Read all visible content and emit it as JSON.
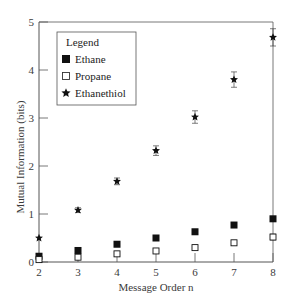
{
  "chart_data": {
    "type": "scatter",
    "title": "",
    "xlabel": "Message Order n",
    "ylabel": "Mutual Information (bits)",
    "x": [
      2,
      3,
      4,
      5,
      6,
      7,
      8
    ],
    "xlim": [
      2,
      8
    ],
    "ylim": [
      0,
      5
    ],
    "xticks": [
      "2",
      "3",
      "4",
      "5",
      "6",
      "7",
      "8"
    ],
    "yticks": [
      "0",
      "1",
      "2",
      "3",
      "4",
      "5"
    ],
    "grid": false,
    "legend_title": "Legend",
    "legend_position": "upper-left",
    "series": [
      {
        "name": "Ethane",
        "marker": "filled-square",
        "color": "#111111",
        "values": [
          0.12,
          0.24,
          0.37,
          0.5,
          0.63,
          0.77,
          0.9
        ],
        "error": [
          0,
          0,
          0,
          0,
          0,
          0,
          0
        ]
      },
      {
        "name": "Propane",
        "marker": "open-square",
        "color": "#111111",
        "values": [
          0.05,
          0.1,
          0.17,
          0.23,
          0.3,
          0.4,
          0.52
        ],
        "error": [
          0,
          0.03,
          0.03,
          0.03,
          0.04,
          0.05,
          0.06
        ]
      },
      {
        "name": "Ethanethiol",
        "marker": "star",
        "color": "#111111",
        "values": [
          0.5,
          1.08,
          1.68,
          2.32,
          3.02,
          3.8,
          4.68
        ],
        "error": [
          0,
          0.05,
          0.07,
          0.1,
          0.13,
          0.16,
          0.18
        ]
      }
    ]
  }
}
